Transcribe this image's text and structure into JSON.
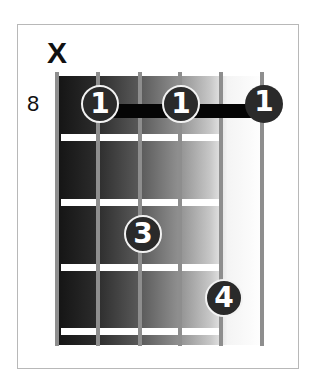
{
  "diagram": {
    "type": "guitar-chord-diagram",
    "start_fret": "8",
    "strings": 6,
    "frets_shown": 4,
    "string_markers": [
      {
        "string": 6,
        "marker": "X"
      }
    ],
    "fingers": [
      {
        "label": "1",
        "string": 5,
        "fret": 1
      },
      {
        "label": "1",
        "string": 3,
        "fret": 1
      },
      {
        "label": "1",
        "string": 1,
        "fret": 1
      },
      {
        "label": "3",
        "string": 4,
        "fret": 3
      },
      {
        "label": "4",
        "string": 2,
        "fret": 4
      }
    ],
    "barre": {
      "fret": 1,
      "from_string": 5,
      "to_string": 1
    },
    "colors": {
      "dot_fill": "#2a2a2a",
      "dot_text": "#ffffff",
      "barre": "#050505",
      "string": "#8e8e8e",
      "fret_line": "#ffffff"
    }
  }
}
